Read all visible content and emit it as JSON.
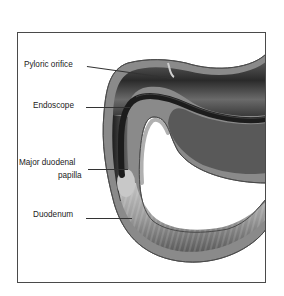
{
  "figure": {
    "type": "anatomical-illustration",
    "labels": [
      {
        "id": "pyloric-orifice",
        "text": "Pyloric orifice"
      },
      {
        "id": "endoscope",
        "text": "Endoscope"
      },
      {
        "id": "major-duodenal-papilla",
        "line1": "Major duodenal",
        "line2": "papilla"
      },
      {
        "id": "duodenum",
        "text": "Duodenum"
      }
    ]
  },
  "colors": {
    "frame_border": "#4a4a4a",
    "label_text": "#222222",
    "wall_outer": "#7a7a7a",
    "lumen_dark": "#2e2e2e",
    "mucosa_light": "#bdbdbd",
    "endoscope": "#1c1c1c"
  }
}
